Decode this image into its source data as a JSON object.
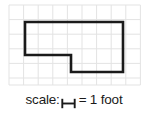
{
  "figure": {
    "grid": {
      "origin_x": 9,
      "origin_y": 5,
      "cell_size": 14.6,
      "cols": 9,
      "rows": 5.5,
      "width": 131,
      "height": 80,
      "line_color": "#e2e2e2",
      "background": "#ffffff"
    },
    "shape": {
      "name": "l-shaped-polygon",
      "stroke_color": "#1a1a1a",
      "stroke_width": 2.6,
      "fill": "none",
      "points": [
        [
          25,
          22
        ],
        [
          123,
          22
        ],
        [
          123,
          72
        ],
        [
          71,
          72
        ],
        [
          71,
          55
        ],
        [
          25,
          55
        ]
      ],
      "points_attr": "25,22 123,22 123,72 71,72 71,55 25,55"
    },
    "scale": {
      "label": "scale:",
      "bar_icon": "scale-bar-icon",
      "equals_text": "= 1 foot",
      "unit_value": "1",
      "unit_name": "foot"
    }
  }
}
